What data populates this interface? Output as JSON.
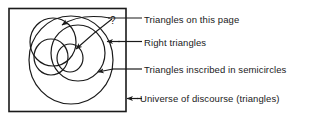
{
  "figure": {
    "type": "venn-diagram",
    "caption_labels": [
      {
        "id": "triangles_on_page",
        "text": "Triangles on this page",
        "pointer": "two curved arrows into upper-left circles"
      },
      {
        "id": "right_triangles",
        "text": "Right triangles",
        "pointer": "straight arrow pointing left"
      },
      {
        "id": "inscribed_semicircles",
        "text": "Triangles inscribed in semicircles",
        "pointer": "arrow pointing down-left"
      },
      {
        "id": "universe_of_discourse",
        "text": "Universe of discourse (triangles)",
        "pointer": "arrow pointing left at rectangle border"
      }
    ],
    "annotations": {
      "question_mark": "?"
    },
    "colors": {
      "stroke": "#1a1a1a",
      "background": "#ffffff",
      "text": "#1a1a1a"
    },
    "shapes": {
      "universe_rect": "outer rectangle enclosing all sets",
      "circles_count": 5
    }
  }
}
